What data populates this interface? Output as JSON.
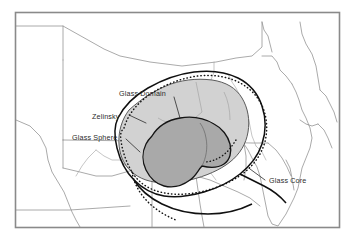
{
  "figure": {
    "kind": "thematic-map",
    "region": "Pennsylvania and adjacent states",
    "background_color": "#ffffff",
    "frame_color": "#8a8a8a"
  },
  "labels": {
    "glass_domain": "Glass Domain",
    "zelinsky": "Zelinsky",
    "glass_sphere": "Glass Sphere",
    "glass_core": "Glass Core"
  },
  "legend_semantics": [
    {
      "name": "Glass Domain",
      "style": "light-gray-filled-region",
      "fill": "#d2d2d2",
      "stroke": "#555555",
      "stroke_style": "solid"
    },
    {
      "name": "Zelinsky",
      "style": "dotted-outline",
      "fill": "none",
      "stroke": "#1a1a1a",
      "stroke_style": "dotted"
    },
    {
      "name": "Glass Sphere",
      "style": "solid-outline",
      "fill": "none",
      "stroke": "#111111",
      "stroke_style": "solid"
    },
    {
      "name": "Glass Core",
      "style": "dark-gray-filled-region",
      "fill": "#a9a9a9",
      "stroke": "#111111",
      "stroke_style": "solid"
    }
  ],
  "colors": {
    "frame": "#8a8a8a",
    "state_boundary": "#8e8e8e",
    "river": "#9a9a9a",
    "domain_fill": "#d2d2d2",
    "domain_stroke": "#5a5a5a",
    "core_fill": "#a9a9a9",
    "core_stroke": "#141414",
    "sphere_stroke": "#101010",
    "zelinsky_stroke": "#141414",
    "label_text": "#2b2b2b",
    "leader_line": "#2b2b2b"
  }
}
